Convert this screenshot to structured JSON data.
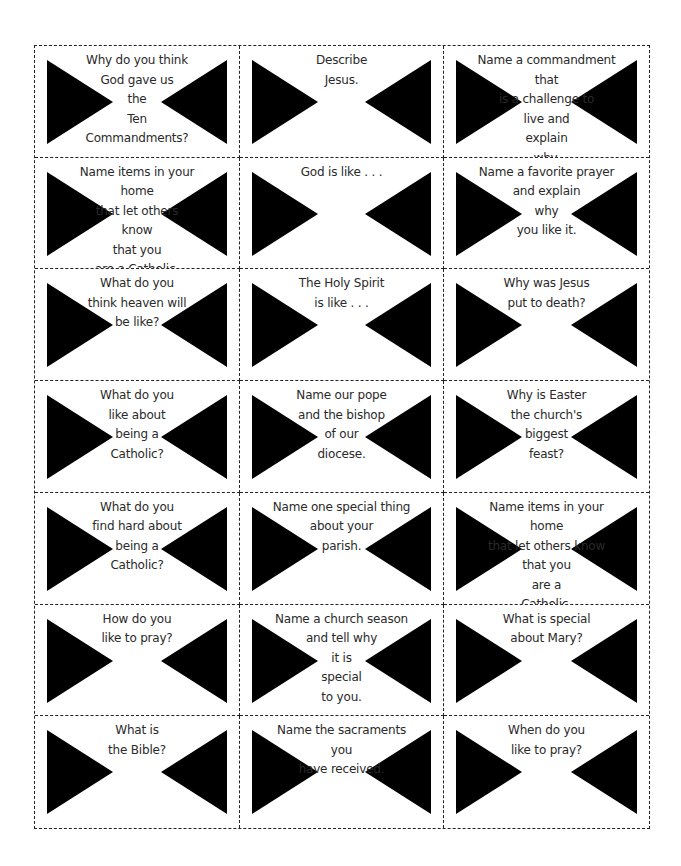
{
  "sheet": {
    "columns": 3,
    "rows": 7,
    "border_style": "dashed cut lines",
    "triangle_color": "#000000",
    "text_color": "#2a2a2a"
  },
  "cards": [
    {
      "text": "Why do you think\nGod gave us\nthe\nTen\nCommandments?"
    },
    {
      "text": "Describe\nJesus."
    },
    {
      "text": "Name a commandment that\nis a challenge to\nlive and\nexplain\nwhy."
    },
    {
      "text": "Name items in your home\nthat let others\nknow\nthat you\nare a Catholic."
    },
    {
      "text": "God is like . . ."
    },
    {
      "text": "Name a favorite prayer\nand explain\nwhy\nyou like it."
    },
    {
      "text": "What do you\nthink heaven will\nbe like?"
    },
    {
      "text": "The Holy Spirit\nis like . . ."
    },
    {
      "text": "Why was Jesus\nput to death?"
    },
    {
      "text": "What do you\nlike about\nbeing a\nCatholic?"
    },
    {
      "text": "Name our pope\nand the bishop\nof our\ndiocese."
    },
    {
      "text": "Why is Easter\nthe church's\nbiggest\nfeast?"
    },
    {
      "text": "What do you\nfind hard about\nbeing a\nCatholic?"
    },
    {
      "text": "Name one special thing\nabout your\nparish."
    },
    {
      "text": "Name items in your home\nthat let others know\nthat you\nare a\nCatholic."
    },
    {
      "text": "How do you\nlike to pray?"
    },
    {
      "text": "Name a church season\nand tell why\nit is\nspecial\nto you."
    },
    {
      "text": "What is special\nabout Mary?"
    },
    {
      "text": "What is\nthe Bible?"
    },
    {
      "text": "Name the sacraments you\nhave received."
    },
    {
      "text": "When do you\nlike to pray?"
    }
  ]
}
